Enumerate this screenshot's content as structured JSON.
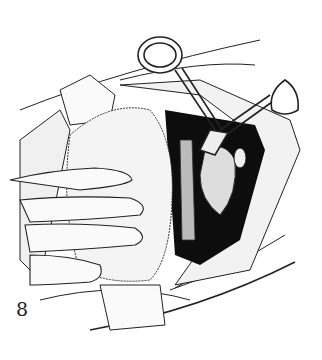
{
  "figure": {
    "label": "8",
    "colors": {
      "ink": "#1a1a1a",
      "background": "#ffffff",
      "cavity": "#0d0d0d"
    }
  }
}
